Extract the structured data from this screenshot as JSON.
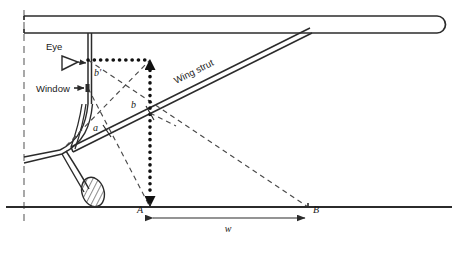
{
  "figure": {
    "kind": "engineering-line-diagram",
    "background_color": "#ffffff",
    "line_color": "#2b2b2b",
    "width": 457,
    "height": 255
  },
  "labels": {
    "eye": "Eye",
    "window": "Window",
    "wing_strut": "Wing strut",
    "point_a": "A",
    "point_b": "B",
    "width_w": "w",
    "angle_a": "a",
    "angle_b": "b",
    "angle_b_prime": "b'"
  },
  "geometry": {
    "centerline_x": 24,
    "ground_y": 207,
    "wing_top_y": 16,
    "wing_bottom_y": 33,
    "wing_tip_x": 437,
    "eye_point": {
      "x": 88,
      "y": 60
    },
    "window_point": {
      "x": 88,
      "y": 88
    },
    "dotted_corner": {
      "x": 150,
      "y": 60
    },
    "point_a_xy": {
      "x": 150,
      "y": 207
    },
    "point_b_xy": {
      "x": 308,
      "y": 207
    },
    "strut_b_intersection": {
      "x": 150,
      "y": 113
    },
    "strut_a_intersection": {
      "x": 107,
      "y": 131
    }
  },
  "icons": {
    "eye_marker": "eye-icon",
    "window_marker": "window-pointer-icon",
    "wheel": "hatched-wheel-icon",
    "arrowhead": "arrowhead-icon"
  }
}
